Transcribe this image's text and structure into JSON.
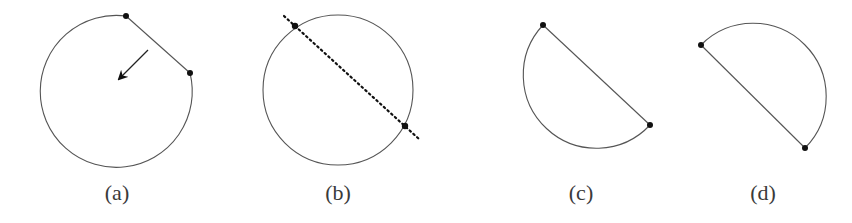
{
  "figures": [
    {
      "id": "a",
      "label": "(a)",
      "description": "Circle with chord removed; arrow pointing toward center",
      "circle": {
        "cx": 116,
        "cy": 93,
        "r": 76
      },
      "points": [
        [
          126,
          16
        ],
        [
          190,
          73
        ]
      ],
      "arrow": {
        "from": [
          148,
          50
        ],
        "to": [
          118,
          80
        ]
      }
    },
    {
      "id": "b",
      "label": "(b)",
      "description": "Full circle cut by a dotted line through two points",
      "circle": {
        "cx": 338,
        "cy": 90,
        "r": 75
      },
      "points": [
        [
          295,
          26
        ],
        [
          405,
          126
        ]
      ],
      "dotted_line": {
        "from": [
          284,
          16
        ],
        "to": [
          419,
          139
        ]
      }
    },
    {
      "id": "c",
      "label": "(c)",
      "description": "Semicircle segment on lower-left side of chord",
      "points": [
        [
          543,
          25
        ],
        [
          650,
          125
        ]
      ],
      "arc_radius": 73
    },
    {
      "id": "d",
      "label": "(d)",
      "description": "Semicircle segment on upper-right side of chord",
      "points": [
        [
          701,
          45
        ],
        [
          805,
          148
        ]
      ],
      "arc_radius": 73
    }
  ],
  "colors": {
    "stroke": "#555555",
    "point": "#111111",
    "label": "#3a3a3a"
  }
}
